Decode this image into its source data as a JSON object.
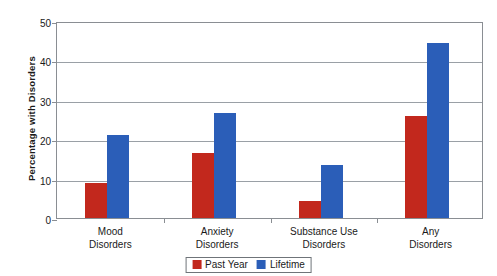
{
  "chart_data": {
    "type": "bar",
    "title": "",
    "xlabel": "",
    "ylabel": "Percentage with Disorders",
    "ylim": [
      0,
      50
    ],
    "yticks": [
      0,
      10,
      20,
      30,
      40,
      50
    ],
    "grid": true,
    "legend_position": "bottom-center",
    "categories": [
      "Mood\nDisorders",
      "Anxiety\nDisorders",
      "Substance Use\nDisorders",
      "Any\nDisorders"
    ],
    "category_lines": [
      [
        "Mood",
        "Disorders"
      ],
      [
        "Anxiety",
        "Disorders"
      ],
      [
        "Substance Use",
        "Disorders"
      ],
      [
        "Any",
        "Disorders"
      ]
    ],
    "series": [
      {
        "name": "Past Year",
        "color": "#C2281D",
        "values": [
          8.8,
          16.6,
          4.4,
          26.0
        ]
      },
      {
        "name": "Lifetime",
        "color": "#2B5EB8",
        "values": [
          21.0,
          26.6,
          13.5,
          44.5
        ]
      }
    ]
  },
  "axis": {
    "y_title": "Percentage with Disorders",
    "y_tick_labels": [
      "0",
      "10",
      "20",
      "30",
      "40",
      "50"
    ]
  },
  "legend": {
    "items": [
      {
        "label": "Past Year",
        "color": "#C2281D"
      },
      {
        "label": "Lifetime",
        "color": "#2B5EB8"
      }
    ]
  },
  "colors": {
    "past_year": "#C2281D",
    "lifetime": "#2B5EB8",
    "grid": "#9aa0a6",
    "frame": "#8a8e93",
    "background": "#ffffff"
  }
}
